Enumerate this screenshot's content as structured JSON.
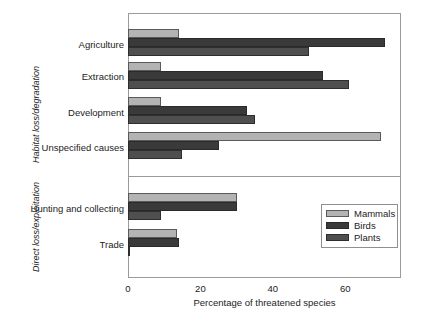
{
  "chart_data": {
    "type": "bar",
    "orientation": "horizontal",
    "title": "",
    "xlabel": "Percentage of threatened species",
    "ylabel": "",
    "xlim": [
      0,
      75
    ],
    "xticks": [
      0,
      20,
      40,
      60
    ],
    "xtick_labels": [
      "0",
      "20",
      "40",
      "60"
    ],
    "grid": false,
    "legend_position": "lower right",
    "series": [
      {
        "name": "Mammals",
        "color": "#b3b3b3",
        "values": [
          14,
          9,
          9,
          70,
          30,
          13.5
        ]
      },
      {
        "name": "Birds",
        "color": "#3a3a3a",
        "values": [
          71,
          54,
          33,
          25,
          30,
          14
        ]
      },
      {
        "name": "Plants",
        "color": "#4f4f4f",
        "values": [
          50,
          61,
          35,
          15,
          9,
          0.5
        ]
      }
    ],
    "categories": [
      "Agriculture",
      "Extraction",
      "Development",
      "Unspecified causes",
      "Hunting and collecting",
      "Trade"
    ],
    "panels": [
      {
        "label": "Habitat loss/degradation",
        "categories": [
          "Agriculture",
          "Extraction",
          "Development",
          "Unspecified causes"
        ]
      },
      {
        "label": "Direct loss/exploitation",
        "categories": [
          "Hunting and collecting",
          "Trade"
        ]
      }
    ]
  },
  "axis": {
    "x_title": "Percentage of threatened species",
    "ticks": [
      {
        "label": "0",
        "value": 0
      },
      {
        "label": "20",
        "value": 20
      },
      {
        "label": "40",
        "value": 40
      },
      {
        "label": "60",
        "value": 60
      }
    ]
  },
  "panel_labels": {
    "top": "Habitat loss/degradation",
    "bottom": "Direct loss/exploitation"
  },
  "category_labels": {
    "agriculture": "Agriculture",
    "extraction": "Extraction",
    "development": "Development",
    "unspecified": "Unspecified causes",
    "hunting": "Hunting and collecting",
    "trade": "Trade"
  },
  "legend": {
    "items": [
      {
        "label": "Mammals",
        "color": "#b3b3b3"
      },
      {
        "label": "Birds",
        "color": "#3a3a3a"
      },
      {
        "label": "Plants",
        "color": "#4f4f4f"
      }
    ]
  }
}
